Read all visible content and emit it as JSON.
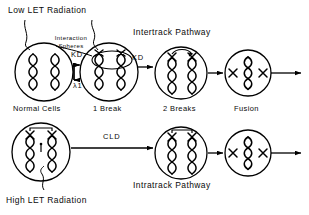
{
  "diagram": {
    "title_top_left": "Low  LET  Radiation",
    "title_bottom_left": "High LET Radiation",
    "pathway_top": "Intertrack  Pathway",
    "pathway_bottom": "Intratrack  Pathway",
    "interaction_label_line1": "Interaction",
    "interaction_label_line2": "Spheres"
  },
  "top_row": {
    "cells": [
      {
        "id": "normal-cells",
        "caption": "Normal Cells",
        "cx": 44,
        "cy": 72,
        "r": 29
      },
      {
        "id": "one-break",
        "caption": "1 Break",
        "cx": 109,
        "cy": 72,
        "r": 29
      },
      {
        "id": "two-breaks",
        "caption": "2 Breaks",
        "cx": 181,
        "cy": 73,
        "r": 26
      },
      {
        "id": "fusion",
        "caption": "Fusion",
        "cx": 248,
        "cy": 73,
        "r": 23
      }
    ],
    "rates": [
      {
        "id": "kd-forward-1",
        "label": "KD",
        "x": 77,
        "y": 55
      },
      {
        "id": "lambda-reverse",
        "label": "λ1",
        "x": 80,
        "y": 85
      },
      {
        "id": "kd-forward-2",
        "label": "KD",
        "x": 132,
        "y": 56
      }
    ]
  },
  "bottom_row": {
    "cells": [
      {
        "id": "crosslinked-cell",
        "caption": "",
        "cx": 41,
        "cy": 152,
        "r": 29
      },
      {
        "id": "two-breaks-intratrack",
        "caption": "",
        "cx": 181,
        "cy": 153,
        "r": 26
      },
      {
        "id": "fusion-intratrack",
        "caption": "",
        "cx": 248,
        "cy": 153,
        "r": 23
      }
    ],
    "rates": [
      {
        "id": "cld-forward",
        "label": "CLD",
        "x": 107,
        "y": 137
      }
    ]
  }
}
